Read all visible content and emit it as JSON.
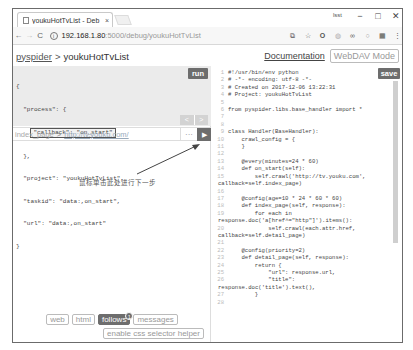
{
  "browser": {
    "tab_title": "youkuHotTvList - Deb",
    "tab_close": "×",
    "window_user": "lsst",
    "window_controls": {
      "minimize": "−",
      "maximize": "□",
      "close": "✕"
    },
    "nav": {
      "back": "←",
      "forward": "→",
      "reload": "C"
    },
    "url_host": "192.168.1.80",
    "url_rest": ":5000/debug/youkuHotTvList",
    "info_icon": "i",
    "extensions": [
      "translate-icon",
      "star-icon",
      "opera-icon",
      "extension-icon",
      "glasses-icon",
      "circle-icon",
      "box-icon",
      "menu-icon"
    ]
  },
  "header": {
    "home": "pyspider",
    "separator": ">",
    "project": "youkuHotTvList",
    "documentation": "Documentation",
    "webdav": "WebDAV Mode"
  },
  "left_panel": {
    "task_json_lines": [
      "{",
      "  \"process\": {",
      "__CALLBACK__",
      "  },",
      "  \"project\": \"youkuHotTvList\",",
      "  \"taskid\": \"data:,on_start\",",
      "  \"url\": \"data:,on_start\"",
      "}"
    ],
    "callback_line": "\"callback\": \"on_start\"",
    "run_label": "run",
    "prev_arrow": "<",
    "next_arrow": ">",
    "follow": {
      "callback": "index_page",
      "arrow": ">",
      "url": "http://tv.youku.com/",
      "more": "···",
      "go": "▶"
    },
    "annotation": "鼠标单击此处进行下一步",
    "bottom_tabs": [
      {
        "label": "web",
        "active": false
      },
      {
        "label": "html",
        "active": false
      },
      {
        "label": "follows",
        "active": true,
        "badge": "1"
      },
      {
        "label": "messages",
        "active": false
      }
    ],
    "css_helper": "enable css selector helper"
  },
  "right_panel": {
    "save_label": "save",
    "code_lines": [
      {
        "n": "1",
        "t": "#!/usr/bin/env python"
      },
      {
        "n": "2",
        "t": "# -*- encoding: utf-8 -*-"
      },
      {
        "n": "3",
        "t": "# Created on 2017-12-06 13:22:31"
      },
      {
        "n": "4",
        "t": "# Project: youkuHotTvList"
      },
      {
        "n": "5",
        "t": ""
      },
      {
        "n": "6",
        "t": "from pyspider.libs.base_handler import *"
      },
      {
        "n": "7",
        "t": ""
      },
      {
        "n": "8",
        "t": ""
      },
      {
        "n": "9",
        "t": "class Handler(BaseHandler):"
      },
      {
        "n": "10",
        "t": "    crawl_config = {"
      },
      {
        "n": "11",
        "t": "    }"
      },
      {
        "n": "12",
        "t": ""
      },
      {
        "n": "13",
        "t": "    @every(minutes=24 * 60)"
      },
      {
        "n": "14",
        "t": "    def on_start(self):"
      },
      {
        "n": "15",
        "t": "        self.crawl('http://tv.youku.com',"
      },
      {
        "n": "",
        "t": "callback=self.index_page)",
        "wrap": true
      },
      {
        "n": "16",
        "t": ""
      },
      {
        "n": "17",
        "t": "    @config(age=10 * 24 * 60 * 60)"
      },
      {
        "n": "18",
        "t": "    def index_page(self, response):"
      },
      {
        "n": "19",
        "t": "        for each in"
      },
      {
        "n": "",
        "t": "response.doc('a[href^=\"http\"]').items():",
        "wrap": true
      },
      {
        "n": "20",
        "t": "            self.crawl(each.attr.href,"
      },
      {
        "n": "",
        "t": "callback=self.detail_page)",
        "wrap": true
      },
      {
        "n": "21",
        "t": ""
      },
      {
        "n": "22",
        "t": "    @config(priority=2)"
      },
      {
        "n": "23",
        "t": "    def detail_page(self, response):"
      },
      {
        "n": "24",
        "t": "        return {"
      },
      {
        "n": "25",
        "t": "            \"url\": response.url,"
      },
      {
        "n": "26",
        "t": "            \"title\":"
      },
      {
        "n": "",
        "t": "response.doc('title').text(),",
        "wrap": true
      },
      {
        "n": "27",
        "t": "        }"
      },
      {
        "n": "28",
        "t": ""
      }
    ]
  }
}
